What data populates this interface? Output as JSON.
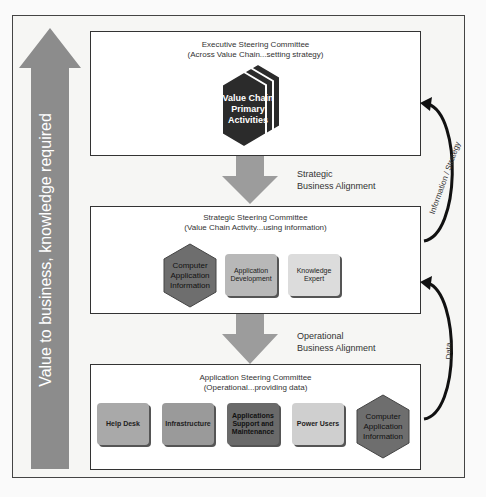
{
  "side_arrow": {
    "label": "Value to business, knowledge required",
    "color": "#8c8c8c"
  },
  "executive": {
    "title": "Executive Steering Committee",
    "subtitle": "(Across Value Chain...setting strategy)",
    "hexagon_label_lines": [
      "Value Chain",
      "Primary",
      "Activities"
    ],
    "hexagon_color": "#2b2b2b"
  },
  "strategic_arrow": {
    "line1": "Strategic",
    "line2": "Business Alignment"
  },
  "strategic": {
    "title": "Strategic Steering Committee",
    "subtitle": "(Value Chain Activity...using information)",
    "items": [
      {
        "label_lines": [
          "Computer",
          "Application",
          "Information"
        ],
        "shape": "hexagon",
        "color": "#6e6e6e"
      },
      {
        "label_lines": [
          "Application",
          "Development"
        ],
        "shape": "tile",
        "color": "#b8b8b8"
      },
      {
        "label_lines": [
          "Knowledge",
          "Expert"
        ],
        "shape": "tile",
        "color": "#dcdcdc"
      }
    ]
  },
  "operational_arrow": {
    "line1": "Operational",
    "line2": "Business Alignment"
  },
  "application": {
    "title": "Application Steering Committee",
    "subtitle": "(Operational...providing data)",
    "items": [
      {
        "label_lines": [
          "Help Desk"
        ],
        "shape": "tile",
        "color": "#a9a9a9"
      },
      {
        "label_lines": [
          "Infrastructure"
        ],
        "shape": "tile",
        "color": "#9a9a9a"
      },
      {
        "label_lines": [
          "Applications",
          "Support and",
          "Maintenance"
        ],
        "shape": "tile",
        "color": "#6a6a6a"
      },
      {
        "label_lines": [
          "Power Users"
        ],
        "shape": "tile",
        "color": "#cfcfcf"
      },
      {
        "label_lines": [
          "Computer",
          "Application",
          "Information"
        ],
        "shape": "hexagon",
        "color": "#6e6e6e"
      }
    ]
  },
  "feedback": {
    "upper_label": "Information / Strategy",
    "lower_label": "Data"
  }
}
